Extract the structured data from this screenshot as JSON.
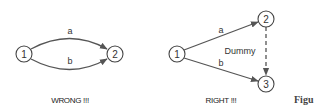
{
  "diagram": {
    "wrong": {
      "caption": "WRONG !!!",
      "nodes": [
        {
          "id": "1",
          "label": "1"
        },
        {
          "id": "2",
          "label": "2"
        }
      ],
      "edges": [
        {
          "from": "1",
          "to": "2",
          "label": "a",
          "style": "solid"
        },
        {
          "from": "1",
          "to": "2",
          "label": "b",
          "style": "solid"
        }
      ]
    },
    "right": {
      "caption": "RIGHT !!!",
      "nodes": [
        {
          "id": "1",
          "label": "1"
        },
        {
          "id": "2",
          "label": "2"
        },
        {
          "id": "3",
          "label": "3"
        }
      ],
      "edges": [
        {
          "from": "1",
          "to": "2",
          "label": "a",
          "style": "solid"
        },
        {
          "from": "1",
          "to": "3",
          "label": "b",
          "style": "solid"
        },
        {
          "from": "2",
          "to": "3",
          "label": "Dummy",
          "style": "dashed"
        }
      ]
    },
    "figure_label_partial": "Figu"
  },
  "colors": {
    "stroke": "#555555",
    "text": "#333333",
    "background": "#ffffff"
  }
}
